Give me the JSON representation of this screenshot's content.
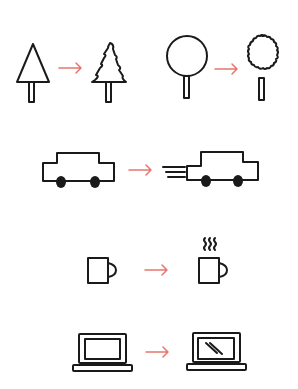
{
  "diagram": {
    "arrow_color": "#e8756e",
    "ink_color": "#1a1a1a",
    "background": "#ffffff",
    "pairs": [
      {
        "id": "pine-tree",
        "before": "plain triangle tree",
        "after": "jagged pine tree"
      },
      {
        "id": "round-tree",
        "before": "plain round tree",
        "after": "bumpy leafy tree"
      },
      {
        "id": "car",
        "before": "static car",
        "after": "car with speed lines"
      },
      {
        "id": "mug",
        "before": "plain mug",
        "after": "steaming mug"
      },
      {
        "id": "laptop",
        "before": "blank laptop",
        "after": "laptop with screen glare"
      }
    ]
  }
}
